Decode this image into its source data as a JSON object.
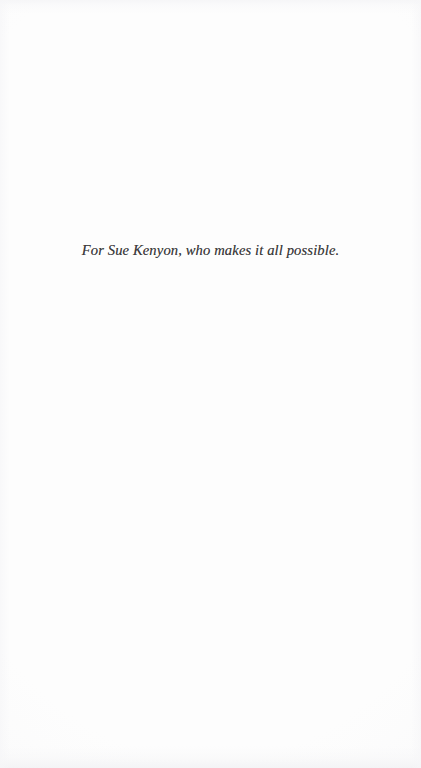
{
  "page": {
    "kind": "book-dedication-page",
    "background_color": "#fdfdfd",
    "text_color": "#3c3b3c"
  },
  "dedication": {
    "text": "For Sue Kenyon, who makes it all possible."
  }
}
